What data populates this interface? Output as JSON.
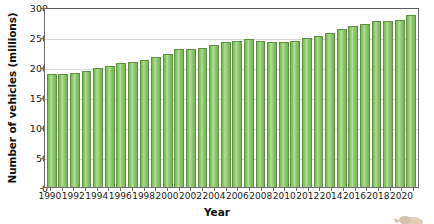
{
  "chart_data": {
    "type": "bar",
    "title": "",
    "xlabel": "Year",
    "ylabel": "Number of vehicles (millions)",
    "ylim": [
      0,
      300
    ],
    "ytick_values": [
      0,
      50,
      100,
      150,
      200,
      250,
      300
    ],
    "ytick_labels": [
      "0",
      "50",
      "100",
      "150",
      "200",
      "250",
      "300"
    ],
    "grid": true,
    "legend": "none",
    "bar_color": "#7dbf5c",
    "bar_edge_color": "#5f8f45",
    "categories": [
      "1990",
      "1991",
      "1992",
      "1993",
      "1994",
      "1995",
      "1996",
      "1997",
      "1998",
      "1999",
      "2000",
      "2001",
      "2002",
      "2003",
      "2004",
      "2005",
      "2006",
      "2007",
      "2008",
      "2009",
      "2010",
      "2011",
      "2012",
      "2013",
      "2014",
      "2015",
      "2016",
      "2017",
      "2018",
      "2019",
      "2020",
      "2021"
    ],
    "xtick_labels": [
      "1990",
      "1992",
      "1994",
      "1996",
      "1998",
      "2000",
      "2002",
      "2004",
      "2006",
      "2008",
      "2010",
      "2012",
      "2014",
      "2016",
      "2018",
      "2020"
    ],
    "values": [
      188,
      188,
      190,
      194,
      198,
      202,
      207,
      208,
      212,
      217,
      222,
      230,
      230,
      231,
      237,
      241,
      244,
      247,
      243,
      242,
      242,
      244,
      248,
      252,
      256,
      264,
      268,
      272,
      276,
      276,
      279,
      287
    ]
  }
}
